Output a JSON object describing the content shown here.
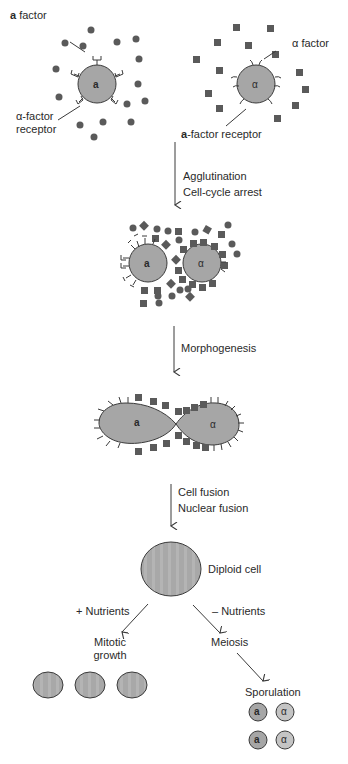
{
  "figure": {
    "stage1": {
      "a_cell": {
        "label": "a",
        "factor_label_bold": "a",
        "factor_label": " factor",
        "receptor_label_line1": "α-factor",
        "receptor_label_line2": "receptor"
      },
      "alpha_cell": {
        "label": "α",
        "factor_label": "α factor",
        "receptor_label_bold": "a",
        "receptor_label": "-factor receptor"
      }
    },
    "step1": {
      "line1": "Agglutination",
      "line2": "Cell-cycle arrest"
    },
    "stage2": {
      "a_label": "a",
      "alpha_label": "α"
    },
    "step2": {
      "line1": "Morphogenesis"
    },
    "stage3": {
      "a_label": "a",
      "alpha_label": "α"
    },
    "step3": {
      "line1": "Cell fusion",
      "line2": "Nuclear fusion"
    },
    "diploid": {
      "label": "Diploid cell"
    },
    "branch_left": {
      "condition": "+ Nutrients",
      "outcome_line1": "Mitotic",
      "outcome_line2": "growth"
    },
    "branch_right": {
      "condition": "– Nutrients",
      "outcome": "Meiosis",
      "next": "Sporulation"
    },
    "spores": [
      "a",
      "α",
      "a",
      "α"
    ],
    "colors": {
      "cell_fill": "#a6a6a6",
      "factor_fill": "#5a5a5a",
      "outline": "#3a3a3a",
      "background": "#ffffff"
    }
  }
}
